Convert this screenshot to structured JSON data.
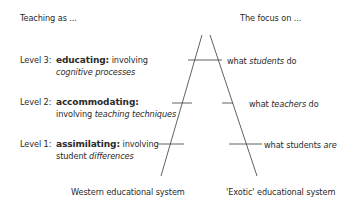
{
  "left_header": "Teaching as ...",
  "right_header": "The focus on ...",
  "levels": [
    {
      "level_label": "Level 3:",
      "term": "educating:",
      "desc_line1": "involving",
      "desc_line2": "cognitive processes",
      "focus_pre": "what ",
      "focus_em": "students",
      "focus_post": " do"
    },
    {
      "level_label": "Level 2:",
      "term": "accommodating:",
      "desc_line2_pre": "involving ",
      "desc_line2_em": "teaching techniques",
      "focus_pre": "what ",
      "focus_em": "teachers",
      "focus_post": " do"
    },
    {
      "level_label": "Level 1:",
      "term": "assimilating:",
      "desc_line1": "involving",
      "desc_line2_pre": "student ",
      "desc_line2_em": "differences",
      "focus_pre": "what students ",
      "focus_em": "are"
    }
  ],
  "bottom_left": "Western educational system",
  "bottom_right": "'Exotic' educational system",
  "line_color": "#3a3a3a"
}
